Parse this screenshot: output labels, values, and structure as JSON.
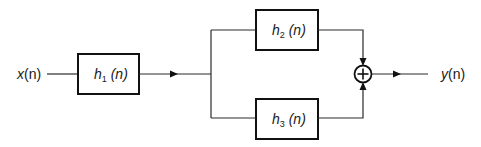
{
  "diagram": {
    "type": "block-diagram",
    "input": {
      "label": "x",
      "arg": "(n)"
    },
    "output": {
      "label": "y",
      "arg": "(n)"
    },
    "blocks": [
      {
        "id": "h1",
        "name": "h",
        "subscript": "1",
        "arg": " (n)"
      },
      {
        "id": "h2",
        "name": "h",
        "subscript": "2",
        "arg": " (n)"
      },
      {
        "id": "h3",
        "name": "h",
        "subscript": "3",
        "arg": " (n)"
      }
    ],
    "summer": {
      "symbol": "+"
    },
    "connections": [
      [
        "x(n)",
        "h1"
      ],
      [
        "h1",
        "junction"
      ],
      [
        "junction",
        "h2"
      ],
      [
        "junction",
        "h3"
      ],
      [
        "h2",
        "summer"
      ],
      [
        "h3",
        "summer"
      ],
      [
        "summer",
        "y(n)"
      ]
    ]
  }
}
